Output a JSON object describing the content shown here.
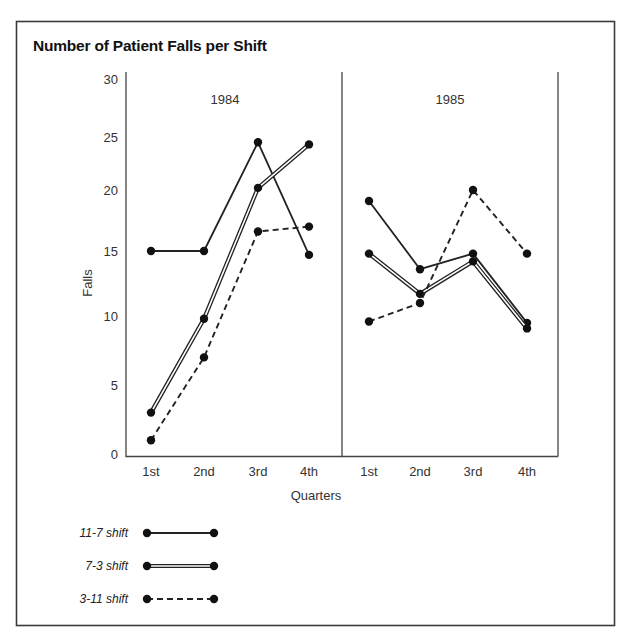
{
  "chart_data": {
    "type": "line",
    "title": "Number of Patient Falls per Shift",
    "xlabel": "Quarters",
    "ylabel": "Falls",
    "ylim": [
      0,
      30
    ],
    "yticks": [
      0,
      5,
      10,
      15,
      20,
      25,
      30
    ],
    "grid": false,
    "legend_position": "bottom-left",
    "panels": [
      {
        "label": "1984",
        "categories": [
          "1st",
          "2nd",
          "3rd",
          "4th"
        ],
        "series": [
          {
            "name": "11-7 shift",
            "style": "solid",
            "values": [
              15,
              15,
              24.5,
              14.7
            ]
          },
          {
            "name": "7-3 shift",
            "style": "double",
            "values": [
              3,
              9.8,
              20.2,
              24.3
            ]
          },
          {
            "name": "3-11 shift",
            "style": "dashed",
            "values": [
              1,
              7,
              16.6,
              17
            ]
          }
        ]
      },
      {
        "label": "1985",
        "categories": [
          "1st",
          "2nd",
          "3rd",
          "4th"
        ],
        "series": [
          {
            "name": "11-7 shift",
            "style": "solid",
            "values": [
              19.1,
              13.6,
              14.8,
              9.5
            ]
          },
          {
            "name": "7-3 shift",
            "style": "double",
            "values": [
              14.8,
              11.7,
              14.2,
              9.1
            ]
          },
          {
            "name": "3-11 shift",
            "style": "dashed",
            "values": [
              9.6,
              11,
              20,
              14.8
            ]
          }
        ]
      }
    ],
    "legend": [
      {
        "label": "11-7 shift",
        "style": "solid"
      },
      {
        "label": "7-3 shift",
        "style": "double"
      },
      {
        "label": "3-11 shift",
        "style": "dashed"
      }
    ]
  },
  "colors": {
    "line": "#222222",
    "frame": "#3a3a3a",
    "background": "#ffffff"
  }
}
